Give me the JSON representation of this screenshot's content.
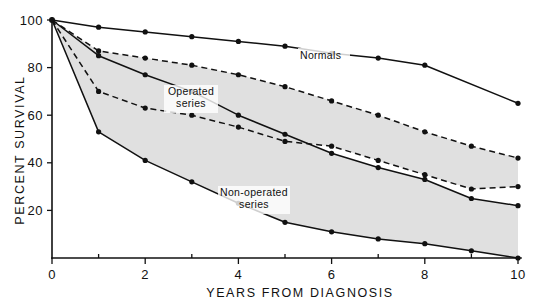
{
  "chart_data": {
    "type": "line",
    "title": "",
    "subtitle": "",
    "xlabel": "YEARS FROM DIAGNOSIS",
    "ylabel": "PERCENT SURVIVAL",
    "xlim": [
      0,
      10
    ],
    "ylim": [
      0,
      100
    ],
    "x_ticks": [
      0,
      2,
      4,
      6,
      8,
      10
    ],
    "x_tick_labels": [
      "0",
      "2",
      "4",
      "6",
      "8",
      "10"
    ],
    "x_minor_ticks": [
      1,
      3,
      5,
      7,
      9
    ],
    "y_ticks": [
      0,
      20,
      40,
      60,
      80,
      100
    ],
    "y_tick_labels": [
      "0",
      "20",
      "40",
      "60",
      "80",
      "100"
    ],
    "grid": false,
    "legend_position": "inline-annotations",
    "series": [
      {
        "name": "Normals",
        "style": "solid",
        "markers": true,
        "x": [
          0,
          1,
          2,
          3,
          4,
          5,
          6,
          7,
          8,
          10
        ],
        "values": [
          100,
          97,
          95,
          93,
          91,
          89,
          86,
          84,
          81,
          65
        ]
      },
      {
        "name": "Operated series (upper)",
        "style": "dashed",
        "markers": true,
        "x": [
          0,
          1,
          2,
          3,
          4,
          5,
          6,
          7,
          8,
          9,
          10
        ],
        "values": [
          100,
          87,
          84,
          81,
          77,
          72,
          66,
          60,
          53,
          47,
          42
        ]
      },
      {
        "name": "Operated series (lower)",
        "style": "dashed",
        "markers": true,
        "x": [
          0,
          1,
          2,
          3,
          4,
          5,
          6,
          7,
          8,
          9,
          10
        ],
        "values": [
          100,
          70,
          63,
          60,
          55,
          49,
          47,
          41,
          35,
          29,
          30
        ]
      },
      {
        "name": "Non-operated series (upper)",
        "style": "solid",
        "markers": true,
        "x": [
          0,
          1,
          2,
          3,
          4,
          5,
          6,
          7,
          8,
          9,
          10
        ],
        "values": [
          100,
          85,
          77,
          70,
          60,
          52,
          44,
          38,
          33,
          25,
          22
        ]
      },
      {
        "name": "Non-operated series (lower)",
        "style": "solid",
        "markers": true,
        "x": [
          0,
          1,
          2,
          3,
          4,
          5,
          6,
          7,
          8,
          9,
          10
        ],
        "values": [
          100,
          53,
          41,
          32,
          23,
          15,
          11,
          8,
          6,
          3,
          0
        ]
      }
    ],
    "bands": [
      {
        "name": "Operated series",
        "upper_series": "Operated series (upper)",
        "lower_series": "Operated series (lower)",
        "shaded": true,
        "fill": "#e0e0e0"
      },
      {
        "name": "Non-operated series",
        "upper_series": "Non-operated series (upper)",
        "lower_series": "Non-operated series (lower)",
        "shaded": true,
        "fill": "#e0e0e0"
      }
    ],
    "annotations": [
      {
        "text": "Normals",
        "x": 5.6,
        "y": 86,
        "id": "normals"
      },
      {
        "text": "Operated",
        "x": 2.8,
        "y": 68,
        "id": "operated-line1"
      },
      {
        "text": "series",
        "x": 2.9,
        "y": 62,
        "id": "operated-line2"
      },
      {
        "text": "Non-operated",
        "x": 5.0,
        "y": 30,
        "id": "nonoperated-line1"
      },
      {
        "text": "series",
        "x": 5.3,
        "y": 24,
        "id": "nonoperated-line2"
      }
    ],
    "colors": {
      "line": "#111111",
      "band_fill": "#e0e0e0",
      "background": "#ffffff",
      "text": "#111111"
    }
  },
  "axes": {
    "y_title": "PERCENT SURVIVAL",
    "x_title": "YEARS FROM DIAGNOSIS",
    "y_labels": [
      "100",
      "80",
      "60",
      "40",
      "20"
    ],
    "x_labels": [
      "0",
      "2",
      "4",
      "6",
      "8",
      "10"
    ],
    "y_origin_label": "0"
  },
  "labels": {
    "normals": "Normals",
    "operated_l1": "Operated",
    "operated_l2": "series",
    "nonoperated_l1": "Non-operated",
    "nonoperated_l2": "series"
  }
}
